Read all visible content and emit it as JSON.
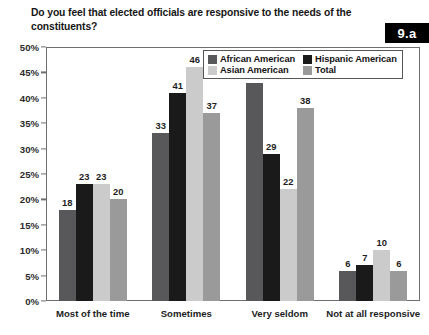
{
  "badge": {
    "label": "9.a"
  },
  "title": "Do you feel that elected officials are responsive to the needs of the constituents?",
  "colors": {
    "african_american": "#58585a",
    "hispanic_american": "#1a1a1a",
    "asian_american": "#cbcbcb",
    "total": "#9a9a9a",
    "axis": "#6f6f6f",
    "text": "#1a1a1a",
    "badge_bg": "#000000",
    "badge_text": "#ffffff"
  },
  "legend": {
    "position": "top-right-inside",
    "entries": [
      {
        "label": "African American",
        "color": "#58585a"
      },
      {
        "label": "Hispanic American",
        "color": "#1a1a1a"
      },
      {
        "label": "Asian American",
        "color": "#cbcbcb"
      },
      {
        "label": "Total",
        "color": "#9a9a9a"
      }
    ]
  },
  "chart_data": {
    "type": "bar",
    "title": "Do you feel that elected officials are responsive to the needs of the constituents?",
    "xlabel": "",
    "ylabel": "",
    "ylim": [
      0,
      50
    ],
    "ytick_step": 5,
    "grid": false,
    "value_labels": true,
    "categories": [
      "Most of the time",
      "Sometimes",
      "Very seldom",
      "Not at all responsive"
    ],
    "ytick_labels": [
      "0%",
      "5%",
      "10%",
      "15%",
      "20%",
      "25%",
      "30%",
      "35%",
      "40%",
      "45%",
      "50%"
    ],
    "ytick_values": [
      0,
      5,
      10,
      15,
      20,
      25,
      30,
      35,
      40,
      45,
      50
    ],
    "series": [
      {
        "name": "African American",
        "color": "#58585a",
        "values": [
          18,
          33,
          43,
          6
        ]
      },
      {
        "name": "Hispanic American",
        "color": "#1a1a1a",
        "values": [
          23,
          41,
          29,
          7
        ]
      },
      {
        "name": "Asian American",
        "color": "#cbcbcb",
        "values": [
          23,
          46,
          22,
          10
        ]
      },
      {
        "name": "Total",
        "color": "#9a9a9a",
        "values": [
          20,
          37,
          38,
          6
        ]
      }
    ]
  }
}
